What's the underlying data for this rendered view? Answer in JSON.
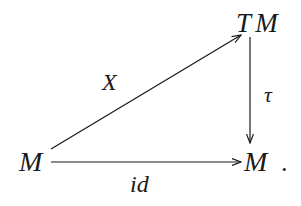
{
  "diagram": {
    "type": "commutative-diagram",
    "nodes": {
      "source": {
        "label": "M"
      },
      "top_right": {
        "label": "T M"
      },
      "target": {
        "label": "M"
      }
    },
    "arrows": {
      "diagonal": {
        "from": "M",
        "to": "T M",
        "label": "X"
      },
      "vertical": {
        "from": "T M",
        "to": "M",
        "label": "τ"
      },
      "horizontal": {
        "from": "M",
        "to": "M",
        "label": "id"
      }
    },
    "trailing_punctuation": "."
  },
  "colors": {
    "ink": "#1a1a1a",
    "background": "#ffffff"
  }
}
